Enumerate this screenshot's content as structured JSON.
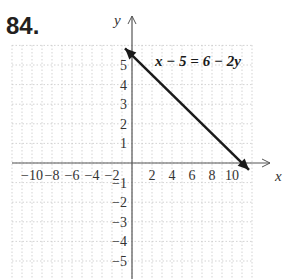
{
  "problem": {
    "number": "84."
  },
  "chart_data": {
    "type": "line",
    "title": "",
    "equation_label": "x − 5 = 6 − 2y",
    "xlabel": "x",
    "ylabel": "y",
    "xlim": [
      -12,
      12
    ],
    "ylim": [
      -5.8,
      6
    ],
    "x_ticks": [
      -10,
      -8,
      -6,
      -4,
      -2,
      2,
      4,
      6,
      8,
      10
    ],
    "x_tick_labels": [
      "−10",
      "−8",
      "−6",
      "−4",
      "−2",
      "2",
      "4",
      "6",
      "8",
      "10"
    ],
    "y_ticks": [
      5,
      4,
      3,
      2,
      1,
      -1,
      -2,
      -3,
      -4,
      -5
    ],
    "y_tick_labels": [
      "5",
      "4",
      "3",
      "2",
      "1",
      "−1",
      "−2",
      "−3",
      "−4",
      "−5"
    ],
    "grid": true,
    "grid_style": "dotted",
    "series": [
      {
        "name": "x − 5 = 6 − 2y",
        "x": [
          -0.7,
          0,
          11,
          11.7
        ],
        "y": [
          5.85,
          5.5,
          0,
          -0.35
        ],
        "arrows": "both",
        "intercepts": {
          "x_intercept": [
            11,
            0
          ],
          "y_intercept": [
            0,
            5.5
          ]
        }
      }
    ],
    "colors": {
      "line": "#1a1a1a",
      "axis": "#555555",
      "grid": "#c8c8c8",
      "text": "#333333"
    }
  }
}
